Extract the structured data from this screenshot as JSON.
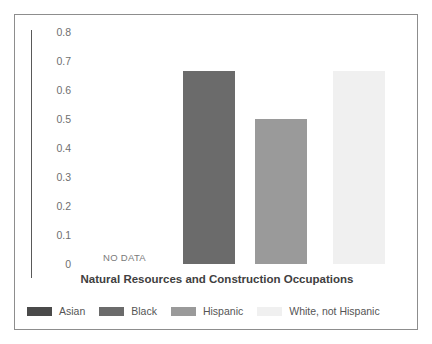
{
  "chart_data": {
    "type": "bar",
    "title": "Natural Resources and Construction Occupations",
    "xlabel": "",
    "ylabel": "",
    "ylim": [
      0,
      0.8
    ],
    "grid": false,
    "legend_position": "bottom",
    "categories": [
      "Asian",
      "Black",
      "Hispanic",
      "White, not Hispanic"
    ],
    "values": [
      null,
      0.665,
      0.5,
      0.665
    ],
    "annotations": [
      {
        "category": "Asian",
        "text": "NO DATA"
      }
    ],
    "ytick_labels": [
      "0.8",
      "0.7",
      "0.6",
      "0.5",
      "0.4",
      "0.3",
      "0.2",
      "0.1",
      "0"
    ],
    "ytick_values": [
      0.8,
      0.7,
      0.6,
      0.5,
      0.4,
      0.3,
      0.2,
      0.1,
      0
    ],
    "series": [
      {
        "name": "Asian",
        "value": null,
        "color": "#4a4a4a",
        "label": "Asian",
        "note": "NO DATA"
      },
      {
        "name": "Black",
        "value": 0.665,
        "color": "#6b6b6b",
        "label": "Black",
        "note": ""
      },
      {
        "name": "Hispanic",
        "value": 0.5,
        "color": "#9a9a9a",
        "label": "Hispanic",
        "note": ""
      },
      {
        "name": "White, not Hispanic",
        "value": 0.665,
        "color": "#f0f0f0",
        "label": "White, not Hispanic",
        "note": ""
      }
    ]
  },
  "legend": {
    "items": [
      {
        "label": "Asian",
        "color": "#4a4a4a"
      },
      {
        "label": "Black",
        "color": "#6b6b6b"
      },
      {
        "label": "Hispanic",
        "color": "#9a9a9a"
      },
      {
        "label": "White, not Hispanic",
        "color": "#f0f0f0"
      }
    ]
  }
}
